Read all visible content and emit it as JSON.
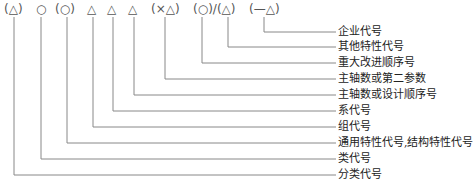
{
  "diagram": {
    "symbols": [
      {
        "text": "(△)",
        "x": 4
      },
      {
        "text": "○",
        "x": 36
      },
      {
        "text": "(○)",
        "x": 55
      },
      {
        "text": "△",
        "x": 87
      },
      {
        "text": "△",
        "x": 107
      },
      {
        "text": "△",
        "x": 128
      },
      {
        "text": "(×△)",
        "x": 151
      },
      {
        "text": "(○)/(△)",
        "x": 193
      },
      {
        "text": "(—△)",
        "x": 249
      }
    ],
    "items": [
      {
        "label": "企业代号",
        "line_x": 264,
        "y": 32
      },
      {
        "label": "其他特性代号",
        "line_x": 228,
        "y": 47
      },
      {
        "label": "重大改进顺序号",
        "line_x": 202,
        "y": 63
      },
      {
        "label": "主轴数或第二参数",
        "line_x": 165,
        "y": 79
      },
      {
        "label": "主轴数或设计顺序号",
        "line_x": 134,
        "y": 95
      },
      {
        "label": "系代号",
        "line_x": 113,
        "y": 111
      },
      {
        "label": "组代号",
        "line_x": 93,
        "y": 127
      },
      {
        "label": "通用特性代号,结构特性代号",
        "line_x": 67,
        "y": 143
      },
      {
        "label": "类代号",
        "line_x": 41,
        "y": 159
      },
      {
        "label": "分类代号",
        "line_x": 14,
        "y": 175
      }
    ],
    "line_color": "#888888",
    "label_x": 338,
    "line_end_x": 336
  }
}
